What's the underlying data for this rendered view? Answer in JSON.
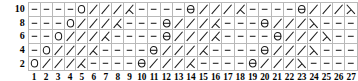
{
  "chart_data": {
    "type": "table",
    "title": "",
    "xlabel": "",
    "ylabel": "",
    "grid": true,
    "columns": 27,
    "rows": 5,
    "col_labels": [
      "1",
      "2",
      "3",
      "4",
      "5",
      "6",
      "7",
      "8",
      "9",
      "10",
      "11",
      "12",
      "13",
      "14",
      "15",
      "16",
      "17",
      "18",
      "19",
      "20",
      "21",
      "22",
      "23",
      "24",
      "25",
      "26",
      "27"
    ],
    "row_labels": [
      "10",
      "8",
      "6",
      "4",
      "2"
    ],
    "symbol_legend": {
      "dash": "knit / purl bar",
      "o": "yarn over (open circle)",
      "theta": "yarn over with bar (circle with horizontal bar)",
      "slash": "diagonal line leaning right",
      "left-dec": "left-leaning decrease (slash with upward leg)",
      "right-dec": "right-leaning decrease (backslash with downward leg)"
    },
    "grid_symbols": [
      [
        "dash",
        "dash",
        "dash",
        "dash",
        "o",
        "slash",
        "slash",
        "slash",
        "left-dec",
        "dash",
        "dash",
        "dash",
        "dash",
        "theta",
        "slash",
        "slash",
        "slash",
        "left-dec",
        "dash",
        "dash",
        "dash",
        "dash",
        "theta",
        "slash",
        "slash",
        "slash",
        "right-dec"
      ],
      [
        "dash",
        "dash",
        "dash",
        "o",
        "slash",
        "slash",
        "slash",
        "left-dec",
        "dash",
        "dash",
        "dash",
        "theta",
        "slash",
        "slash",
        "slash",
        "left-dec",
        "dash",
        "dash",
        "dash",
        "theta",
        "slash",
        "slash",
        "slash",
        "right-dec",
        "dash",
        "dash",
        "dash"
      ],
      [
        "dash",
        "dash",
        "o",
        "slash",
        "slash",
        "slash",
        "left-dec",
        "dash",
        "dash",
        "dash",
        "dash",
        "theta",
        "slash",
        "slash",
        "slash",
        "left-dec",
        "dash",
        "dash",
        "dash",
        "dash",
        "theta",
        "slash",
        "slash",
        "slash",
        "right-dec",
        "dash",
        "dash"
      ],
      [
        "dash",
        "o",
        "slash",
        "slash",
        "slash",
        "left-dec",
        "dash",
        "dash",
        "dash",
        "dash",
        "theta",
        "slash",
        "slash",
        "slash",
        "left-dec",
        "dash",
        "dash",
        "dash",
        "dash",
        "theta",
        "slash",
        "slash",
        "slash",
        "right-dec",
        "dash",
        "dash",
        "dash"
      ],
      [
        "o",
        "slash",
        "slash",
        "slash",
        "left-dec",
        "dash",
        "dash",
        "dash",
        "dash",
        "theta",
        "slash",
        "slash",
        "slash",
        "left-dec",
        "dash",
        "dash",
        "dash",
        "dash",
        "theta",
        "slash",
        "slash",
        "slash",
        "right-dec",
        "dash",
        "dash",
        "dash",
        "dash"
      ]
    ],
    "colors": {
      "ink": "#1a1a1a",
      "gridline": "#b9b9b9",
      "background": "#ffffff"
    }
  }
}
